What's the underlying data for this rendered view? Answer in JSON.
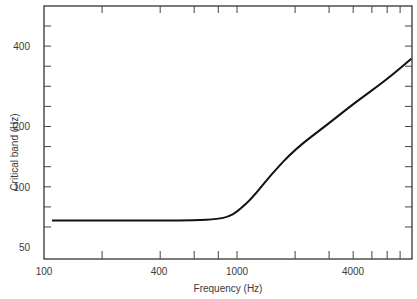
{
  "chart_data": {
    "type": "line",
    "title": "",
    "xlabel": "Frequency (Hz)",
    "ylabel": "Critical band (Hz)",
    "xscale": "log",
    "yscale": "log",
    "xlim": [
      100,
      8000
    ],
    "ylim": [
      40,
      550
    ],
    "grid": false,
    "legend": null,
    "x_tick_labels": [
      "100",
      "400",
      "1000",
      "4000"
    ],
    "x_tick_values": [
      100,
      400,
      1000,
      4000
    ],
    "y_tick_labels": [
      "50",
      "100",
      "200",
      "400"
    ],
    "y_tick_values": [
      50,
      100,
      200,
      400
    ],
    "series": [
      {
        "name": "Critical band",
        "x": [
          110,
          200,
          400,
          600,
          800,
          900,
          1000,
          1200,
          1500,
          2000,
          3000,
          4000,
          6000,
          8000
        ],
        "values": [
          68,
          68,
          68,
          68,
          69,
          71,
          75,
          88,
          115,
          154,
          205,
          242,
          300,
          358
        ]
      }
    ]
  },
  "labels": {
    "y": [
      "400",
      "200",
      "100",
      "50"
    ],
    "x": [
      "100",
      "400",
      "1000",
      "4000"
    ],
    "xtitle": "Frequency (Hz)",
    "ytitle": "Critical band (Hz)"
  }
}
